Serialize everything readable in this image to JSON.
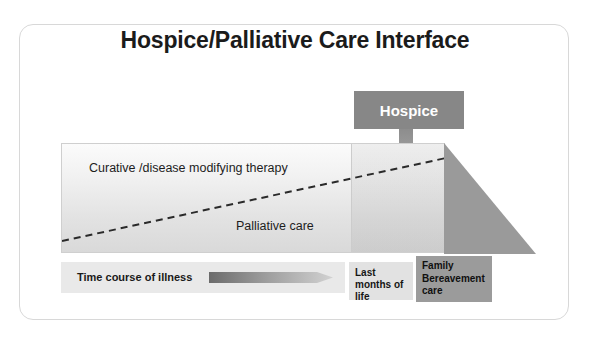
{
  "slide": {
    "title": "Hospice/Palliative Care Interface",
    "background_color": "#ffffff",
    "card_border_color": "#d8d8d8"
  },
  "diagram": {
    "type": "conceptual-timeline",
    "callout": {
      "label": "Hospice",
      "box_color": "#878787",
      "text_color": "#ffffff",
      "arrow_icon": "down-arrow-icon"
    },
    "panel": {
      "upper_region_label": "Curative /disease modifying therapy",
      "lower_region_label": "Palliative care",
      "divider_style": "dashed",
      "divider_color": "#2a2a2a",
      "fill_top_color": "#fbfbfb",
      "fill_bottom_color": "#d9d9d9"
    },
    "bereavement_triangle": {
      "fill_color": "#9a9a9a",
      "shape": "right-triangle"
    },
    "timeline_bar": {
      "label": "Time course of illness",
      "arrow_icon": "right-arrow-icon",
      "arrow_gradient_start": "#6f6f6f",
      "arrow_gradient_end": "#cfcfcf",
      "background_color": "#e9e9e9"
    },
    "phases": [
      {
        "name": "last-months",
        "label": "Last months of life",
        "background_color": "#e2e2e2"
      },
      {
        "name": "family-bereavement",
        "label": "Family Bereavement care",
        "background_color": "#9b9b9b"
      }
    ]
  }
}
